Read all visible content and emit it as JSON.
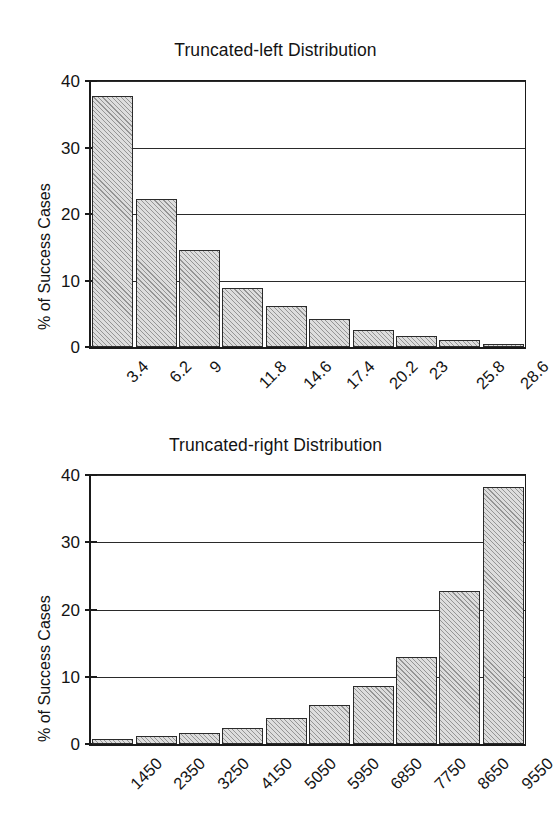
{
  "figure": {
    "background": "#ffffff",
    "ink_color": "#131313",
    "bar_fill": "#dddddd",
    "bar_edge": "#2b2b2b"
  },
  "chart_data": [
    {
      "id": "truncated-left",
      "type": "bar",
      "title": "Truncated-left Distribution",
      "xlabel": "",
      "ylabel": "% of Success Cases",
      "ylim": [
        0,
        40
      ],
      "yticks": [
        0,
        10,
        20,
        30,
        40
      ],
      "ytick_labels": [
        "0",
        "10",
        "20",
        "30",
        "40"
      ],
      "grid": true,
      "legend": "none",
      "categories": [
        "3.4",
        "6.2",
        "9",
        "11.8",
        "14.6",
        "17.4",
        "20.2",
        "23",
        "25.8",
        "28.6"
      ],
      "values": [
        37.8,
        22.2,
        14.6,
        8.9,
        6.2,
        4.2,
        2.5,
        1.7,
        1.0,
        0.5
      ]
    },
    {
      "id": "truncated-right",
      "type": "bar",
      "title": "Truncated-right Distribution",
      "xlabel": "",
      "ylabel": "% of Success Cases",
      "ylim": [
        0,
        40
      ],
      "yticks": [
        0,
        10,
        20,
        30,
        40
      ],
      "ytick_labels": [
        "0",
        "10",
        "20",
        "30",
        "40"
      ],
      "grid": true,
      "legend": "none",
      "categories": [
        "1450",
        "2350",
        "3250",
        "4150",
        "5050",
        "5950",
        "6850",
        "7750",
        "8650",
        "9550"
      ],
      "values": [
        0.8,
        1.2,
        1.7,
        2.4,
        3.9,
        5.8,
        8.7,
        12.9,
        22.7,
        38.2
      ]
    }
  ]
}
